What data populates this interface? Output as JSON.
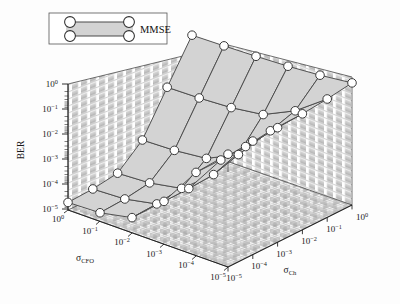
{
  "figure": {
    "kind": "3d-surface-mesh-plot",
    "background_color": "#fdfdfd",
    "surface_face_color": "#d3d3d3",
    "mesh_line_color": "#4a4a4a",
    "marker_face_color": "#ffffff",
    "marker_edge_color": "#3a3a3a",
    "axis_color": "#1a1a1a"
  },
  "legend": {
    "entries": [
      {
        "label": "MMSE",
        "marker": "circle",
        "face_color": "#d3d3d3",
        "line_color": "#4a4a4a"
      }
    ],
    "border_color": "#555555",
    "background": "#ffffff"
  },
  "axes": {
    "z": {
      "label": "BER",
      "scale": "log",
      "ticks": [
        "10^0",
        "10^-1",
        "10^-2",
        "10^-3",
        "10^-4",
        "10^-5"
      ],
      "tick_labels": [
        {
          "mant": "10",
          "exp": "0"
        },
        {
          "mant": "10",
          "exp": "−1"
        },
        {
          "mant": "10",
          "exp": "−2"
        },
        {
          "mant": "10",
          "exp": "−3"
        },
        {
          "mant": "10",
          "exp": "−4"
        },
        {
          "mant": "10",
          "exp": "−5"
        }
      ],
      "limits": [
        "1e-5",
        "1e0"
      ]
    },
    "x": {
      "label_mant": "σ",
      "label_sub": "CFO",
      "scale": "log",
      "tick_labels": [
        {
          "mant": "10",
          "exp": "0"
        },
        {
          "mant": "10",
          "exp": "−1"
        },
        {
          "mant": "10",
          "exp": "−2"
        },
        {
          "mant": "10",
          "exp": "−3"
        },
        {
          "mant": "10",
          "exp": "−4"
        },
        {
          "mant": "10",
          "exp": "−5"
        }
      ],
      "limits": [
        "1e-5",
        "1e0"
      ],
      "direction": "decreasing-to-front-right"
    },
    "y": {
      "label_mant": "σ",
      "label_sub": "Ch",
      "scale": "log",
      "tick_labels": [
        {
          "mant": "10",
          "exp": "−5"
        },
        {
          "mant": "10",
          "exp": "−4"
        },
        {
          "mant": "10",
          "exp": "−3"
        },
        {
          "mant": "10",
          "exp": "−2"
        },
        {
          "mant": "10",
          "exp": "−1"
        },
        {
          "mant": "10",
          "exp": "0"
        }
      ],
      "limits": [
        "1e-5",
        "1e0"
      ],
      "direction": "increasing-to-right"
    }
  },
  "chart_data": {
    "type": "surface",
    "title": "",
    "xlabel": "σ_CFO",
    "ylabel": "σ_Ch",
    "zlabel": "BER",
    "xscale": "log",
    "yscale": "log",
    "zscale": "log",
    "xlim": [
      1e-05,
      1.0
    ],
    "ylim": [
      1e-05,
      1.0
    ],
    "zlim": [
      1e-05,
      1.0
    ],
    "grid": true,
    "legend_position": "top-left",
    "series_name": "MMSE",
    "x": [
      1e-05,
      0.0001,
      0.001,
      0.01,
      0.1,
      1.0
    ],
    "y": [
      1e-05,
      0.0001,
      0.001,
      0.01,
      0.1,
      1.0
    ],
    "z_rows_note": "rows indexed by sigma_CFO (x), columns by sigma_Ch (y); values are BER",
    "z": [
      [
        2e-05,
        2.2e-05,
        3e-05,
        0.0002,
        0.008,
        0.3
      ],
      [
        2.2e-05,
        2.5e-05,
        3.5e-05,
        0.00022,
        0.0085,
        0.32
      ],
      [
        4e-05,
        4.5e-05,
        6e-05,
        0.0003,
        0.01,
        0.35
      ],
      [
        0.0005,
        0.00052,
        0.0006,
        0.0012,
        0.015,
        0.4
      ],
      [
        0.02,
        0.02,
        0.022,
        0.03,
        0.06,
        0.5
      ],
      [
        0.3,
        0.32,
        0.35,
        0.4,
        0.5,
        0.7
      ]
    ]
  }
}
